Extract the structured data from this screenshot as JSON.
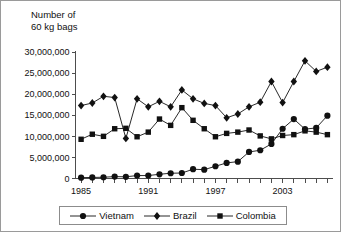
{
  "chart_data": {
    "type": "line",
    "title": "Number of\n60 kg bags",
    "xlabel": "",
    "ylabel": "Number of 60 kg bags",
    "x": [
      1985,
      1986,
      1987,
      1988,
      1989,
      1990,
      1991,
      1992,
      1993,
      1994,
      1995,
      1996,
      1997,
      1998,
      1999,
      2000,
      2001,
      2002,
      2003,
      2004,
      2005,
      2006,
      2007
    ],
    "xlim": [
      1984.5,
      2007.5
    ],
    "ylim": [
      0,
      30000000
    ],
    "yticks": [
      0,
      5000000,
      10000000,
      15000000,
      20000000,
      25000000,
      30000000
    ],
    "ytick_labels": [
      "0",
      "5,000,000",
      "10,000,000",
      "15,000,000",
      "20,000,000",
      "25,000,000",
      "30,000,000"
    ],
    "xticks": [
      1985,
      1991,
      1997,
      2003
    ],
    "xtick_labels": [
      "1985",
      "1991",
      "1997",
      "2003"
    ],
    "grid": false,
    "legend_position": "bottom",
    "series": [
      {
        "name": "Vietnam",
        "marker": "circle",
        "values": [
          200000,
          250000,
          300000,
          450000,
          400000,
          700000,
          700000,
          1000000,
          1250000,
          1300000,
          2200000,
          2100000,
          2900000,
          3700000,
          4000000,
          6300000,
          6700000,
          8200000,
          11800000,
          14100000,
          11700000,
          12000000,
          14900000
        ]
      },
      {
        "name": "Brazil",
        "marker": "diamond",
        "values": [
          17300000,
          17900000,
          19500000,
          19200000,
          9500000,
          18900000,
          17000000,
          18300000,
          17000000,
          21000000,
          18900000,
          17800000,
          17300000,
          14400000,
          15300000,
          17000000,
          18100000,
          23000000,
          18000000,
          23000000,
          27900000,
          25400000,
          26400000
        ]
      },
      {
        "name": "Colombia",
        "marker": "square",
        "values": [
          9300000,
          10500000,
          10000000,
          11800000,
          11900000,
          9900000,
          11000000,
          14100000,
          12600000,
          16800000,
          13800000,
          11800000,
          9900000,
          10700000,
          11000000,
          11500000,
          10100000,
          9400000,
          10200000,
          10400000,
          11300000,
          11000000,
          10400000
        ]
      }
    ]
  },
  "legend": {
    "items": [
      {
        "label": "Vietnam",
        "marker": "circle"
      },
      {
        "label": "Brazil",
        "marker": "diamond"
      },
      {
        "label": "Colombia",
        "marker": "square"
      }
    ]
  }
}
